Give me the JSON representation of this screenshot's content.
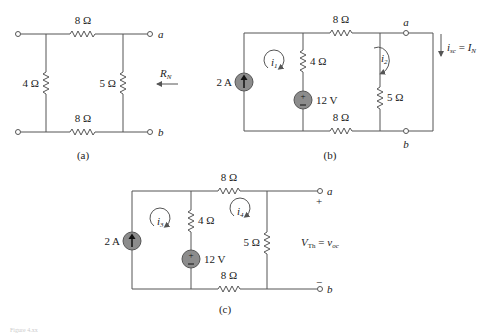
{
  "figure": {
    "caption_partial": "Figure 4.xx",
    "panels": [
      {
        "id": "a",
        "label": "(a)",
        "components": {
          "top_resistor": "8 Ω",
          "bottom_resistor": "8 Ω",
          "left_resistor": "4 Ω",
          "right_resistor": "5 Ω"
        },
        "terminals": {
          "top": "a",
          "bottom": "b"
        },
        "annotation": {
          "arrow_label": "R",
          "arrow_label_sub": "N"
        }
      },
      {
        "id": "b",
        "label": "(b)",
        "components": {
          "current_source": "2 A",
          "voltage_source": "12 V",
          "series_resistor": "4 Ω",
          "top_resistor": "8 Ω",
          "bottom_resistor": "8 Ω",
          "shunt_resistor": "5 Ω"
        },
        "mesh_currents": {
          "left": "i",
          "left_sub": "1",
          "right": "i",
          "right_sub": "2"
        },
        "terminals": {
          "top": "a",
          "bottom": "b"
        },
        "annotation": {
          "lhs": "i",
          "lhs_sub": "sc",
          "eq": " = ",
          "rhs": "I",
          "rhs_sub": "N"
        }
      },
      {
        "id": "c",
        "label": "(c)",
        "components": {
          "current_source": "2 A",
          "voltage_source": "12 V",
          "series_resistor": "4 Ω",
          "top_resistor": "8 Ω",
          "bottom_resistor": "8 Ω",
          "shunt_resistor": "5 Ω"
        },
        "mesh_currents": {
          "left": "i",
          "left_sub": "3",
          "right": "i",
          "right_sub": "4"
        },
        "terminals": {
          "top": "a",
          "bottom": "b",
          "plus": "+",
          "minus": "−"
        },
        "annotation": {
          "lhs": "V",
          "lhs_sub": "Th",
          "eq": " = ",
          "rhs": "v",
          "rhs_sub": "oc"
        }
      }
    ],
    "source_symbol": {
      "plus": "+",
      "minus": "−"
    }
  },
  "colors": {
    "wire": "#555555",
    "source_fill": "#8c8c8c",
    "text": "#222222",
    "background": "#ffffff"
  }
}
